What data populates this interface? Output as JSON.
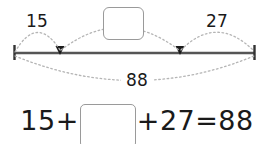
{
  "worksheet": {
    "type": "bar-model-addition",
    "diagram": {
      "left_segment_label": "15",
      "middle_segment_label": "",
      "right_segment_label": "27",
      "total_label": "88",
      "middle_segment_is_blank": true,
      "line_color": "#555555",
      "arc_color": "#b0b0b0",
      "box_border_color": "#9a9a9a",
      "text_color": "#1a1a1a"
    },
    "equation": {
      "first_term": "15",
      "plus_1": "+",
      "blank_value": "",
      "plus_2": "+",
      "third_term": "27",
      "equals": "=",
      "result": "88"
    }
  }
}
